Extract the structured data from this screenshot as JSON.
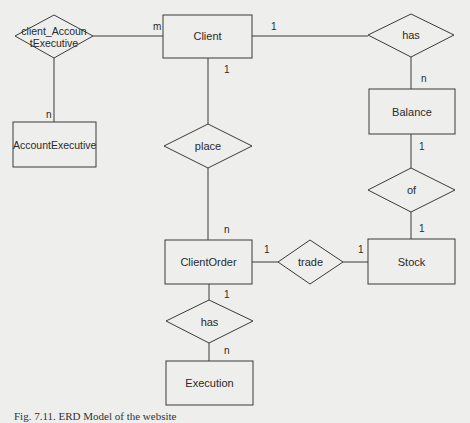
{
  "diagram": {
    "type": "ER diagram",
    "entities": {
      "client": "Client",
      "account_executive": "AccountExecutive",
      "balance": "Balance",
      "client_order": "ClientOrder",
      "stock": "Stock",
      "execution": "Execution"
    },
    "relationships": {
      "client_account_executive": "client_AccountExecutive",
      "client_account_executive_line1": "client_Accoun",
      "client_account_executive_line2": "tExecutive",
      "has_top": "has",
      "place": "place",
      "of": "of",
      "trade": "trade",
      "has_bottom": "has"
    },
    "cardinalities": {
      "client_cae": "m",
      "cae_account_executive": "n",
      "client_has": "1",
      "has_balance": "n",
      "client_place": "1",
      "place_clientorder": "n",
      "balance_of": "1",
      "of_stock": "1",
      "clientorder_trade": "1",
      "trade_stock": "1",
      "clientorder_has": "1",
      "has_execution": "n"
    },
    "edges": [
      {
        "from": "Client",
        "to": "client_AccountExecutive",
        "card": "m"
      },
      {
        "from": "client_AccountExecutive",
        "to": "AccountExecutive",
        "card": "n"
      },
      {
        "from": "Client",
        "to": "has",
        "card": "1"
      },
      {
        "from": "has",
        "to": "Balance",
        "card": "n"
      },
      {
        "from": "Client",
        "to": "place",
        "card": "1"
      },
      {
        "from": "place",
        "to": "ClientOrder",
        "card": "n"
      },
      {
        "from": "Balance",
        "to": "of",
        "card": "1"
      },
      {
        "from": "of",
        "to": "Stock",
        "card": "1"
      },
      {
        "from": "ClientOrder",
        "to": "trade",
        "card": "1"
      },
      {
        "from": "trade",
        "to": "Stock",
        "card": "1"
      },
      {
        "from": "ClientOrder",
        "to": "has",
        "card": "1"
      },
      {
        "from": "has",
        "to": "Execution",
        "card": "n"
      }
    ]
  },
  "caption": "Fig. 7.11. ERD Model of the website"
}
